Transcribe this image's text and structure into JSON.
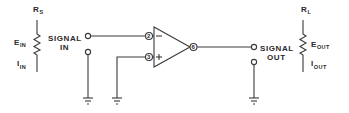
{
  "diagram": {
    "type": "op-amp circuit schematic",
    "source": {
      "resistor_label": "R",
      "resistor_sub": "S",
      "voltage_label": "E",
      "voltage_sub": "IN",
      "current_label": "I",
      "current_sub": "IN"
    },
    "input_terminal": {
      "line1": "SIGNAL",
      "line2": "IN"
    },
    "opamp": {
      "inverting_pin": "2",
      "noninverting_pin": "3",
      "output_pin": "6",
      "inverting_sign": "−",
      "noninverting_sign": "+"
    },
    "output_terminal": {
      "line1": "SIGNAL",
      "line2": "OUT"
    },
    "load": {
      "resistor_label": "R",
      "resistor_sub": "L",
      "voltage_label": "E",
      "voltage_sub": "OUT",
      "current_label": "I",
      "current_sub": "OUT"
    },
    "colors": {
      "line": "#3a3a3a",
      "text": "#2a2a2a",
      "background": "#ffffff"
    }
  }
}
